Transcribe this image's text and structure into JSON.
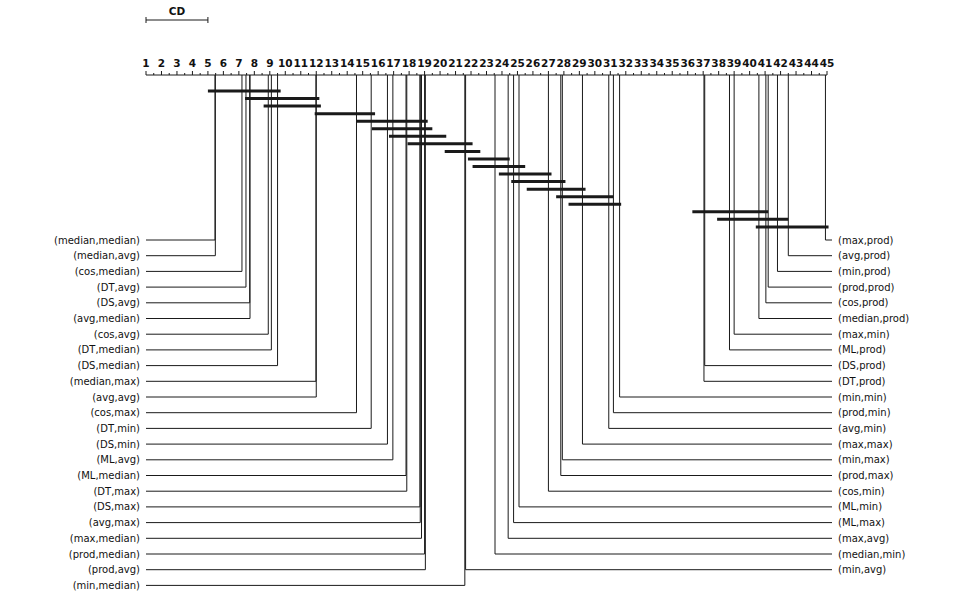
{
  "chart_data": {
    "type": "critical-difference-diagram",
    "title": "",
    "axis": {
      "min_rank": 1,
      "max_rank": 45,
      "tick_labels": [
        "1",
        "2",
        "3",
        "4",
        "5",
        "6",
        "7",
        "8",
        "9",
        "10",
        "11",
        "12",
        "13",
        "14",
        "15",
        "16",
        "17",
        "18",
        "19",
        "20",
        "21",
        "22",
        "23",
        "24",
        "25",
        "26",
        "27",
        "28",
        "29",
        "30",
        "31",
        "32",
        "33",
        "34",
        "35",
        "36",
        "37",
        "38",
        "39",
        "40",
        "41",
        "42",
        "43",
        "44",
        "45"
      ]
    },
    "cd": {
      "label": "CD",
      "value": 4.0
    },
    "left_methods": [
      {
        "name": "(median,median)",
        "rank": 5.46
      },
      {
        "name": "(median,avg)",
        "rank": 5.48
      },
      {
        "name": "(cos,median)",
        "rank": 7.2
      },
      {
        "name": "(DT,avg)",
        "rank": 7.46
      },
      {
        "name": "(DS,avg)",
        "rank": 7.7
      },
      {
        "name": "(avg,median)",
        "rank": 7.72
      },
      {
        "name": "(cos,avg)",
        "rank": 8.9
      },
      {
        "name": "(DT,median)",
        "rank": 9.1
      },
      {
        "name": "(DS,median)",
        "rank": 9.5
      },
      {
        "name": "(median,max)",
        "rank": 11.98
      },
      {
        "name": "(avg,avg)",
        "rank": 12.0
      },
      {
        "name": "(cos,max)",
        "rank": 14.6
      },
      {
        "name": "(DT,min)",
        "rank": 15.55
      },
      {
        "name": "(DS,min)",
        "rank": 16.6
      },
      {
        "name": "(ML,avg)",
        "rank": 16.95
      },
      {
        "name": "(ML,median)",
        "rank": 17.8
      },
      {
        "name": "(DT,max)",
        "rank": 17.85
      },
      {
        "name": "(DS,max)",
        "rank": 18.7
      },
      {
        "name": "(avg,max)",
        "rank": 18.72
      },
      {
        "name": "(max,median)",
        "rank": 18.8
      },
      {
        "name": "(prod,median)",
        "rank": 19.0
      },
      {
        "name": "(prod,avg)",
        "rank": 19.05
      },
      {
        "name": "(min,median)",
        "rank": 21.6
      }
    ],
    "right_methods": [
      {
        "name": "(max,prod)",
        "rank": 44.9
      },
      {
        "name": "(avg,prod)",
        "rank": 42.5
      },
      {
        "name": "(min,prod)",
        "rank": 41.8
      },
      {
        "name": "(prod,prod)",
        "rank": 41.2
      },
      {
        "name": "(cos,prod)",
        "rank": 41.05
      },
      {
        "name": "(median,prod)",
        "rank": 40.6
      },
      {
        "name": "(max,min)",
        "rank": 39.0
      },
      {
        "name": "(ML,prod)",
        "rank": 38.7
      },
      {
        "name": "(DS,prod)",
        "rank": 37.1
      },
      {
        "name": "(DT,prod)",
        "rank": 37.05
      },
      {
        "name": "(min,min)",
        "rank": 31.6
      },
      {
        "name": "(prod,min)",
        "rank": 31.2
      },
      {
        "name": "(avg,min)",
        "rank": 30.9
      },
      {
        "name": "(max,max)",
        "rank": 29.2
      },
      {
        "name": "(min,max)",
        "rank": 27.9
      },
      {
        "name": "(prod,max)",
        "rank": 27.8
      },
      {
        "name": "(cos,min)",
        "rank": 27.0
      },
      {
        "name": "(ML,min)",
        "rank": 25.1
      },
      {
        "name": "(ML,max)",
        "rank": 24.75
      },
      {
        "name": "(max,avg)",
        "rank": 24.4
      },
      {
        "name": "(median,min)",
        "rank": 23.55
      },
      {
        "name": "(min,avg)",
        "rank": 21.65
      }
    ],
    "cliques": [
      [
        5.0,
        9.7
      ],
      [
        7.4,
        12.2
      ],
      [
        8.6,
        12.3
      ],
      [
        11.9,
        15.8
      ],
      [
        14.6,
        19.2
      ],
      [
        15.6,
        19.5
      ],
      [
        16.7,
        20.4
      ],
      [
        17.9,
        22.1
      ],
      [
        20.3,
        22.6
      ],
      [
        21.8,
        24.5
      ],
      [
        22.1,
        25.5
      ],
      [
        23.8,
        27.2
      ],
      [
        24.6,
        28.1
      ],
      [
        25.6,
        29.4
      ],
      [
        27.5,
        31.2
      ],
      [
        28.3,
        31.7
      ],
      [
        36.3,
        41.2
      ],
      [
        37.9,
        42.5
      ],
      [
        40.4,
        45.1
      ]
    ]
  }
}
